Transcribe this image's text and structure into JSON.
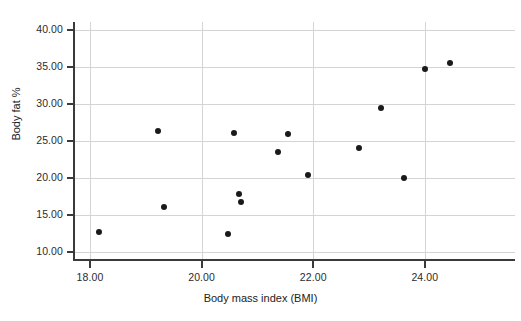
{
  "chart_data": {
    "type": "scatter",
    "title": "",
    "xlabel": "Body mass index (BMI)",
    "ylabel": "Body fat %",
    "xlim": [
      17.55,
      25.45
    ],
    "ylim": [
      8.3,
      41.5
    ],
    "xticks": [
      "18.00",
      "20.00",
      "22.00",
      "24.00"
    ],
    "xtick_values": [
      18,
      20,
      22,
      24
    ],
    "yticks": [
      "10.00",
      "15.00",
      "20.00",
      "25.00",
      "30.00",
      "35.00",
      "40.00"
    ],
    "ytick_values": [
      10,
      15,
      20,
      25,
      30,
      35,
      40
    ],
    "grid": "horizontal-and-vertical",
    "legend": "none",
    "marker": {
      "shape": "circle",
      "color": "#1a1a1a",
      "size": 6
    },
    "points": [
      {
        "x": 18.16,
        "y": 12.7
      },
      {
        "x": 19.22,
        "y": 26.3
      },
      {
        "x": 19.33,
        "y": 16.1
      },
      {
        "x": 20.47,
        "y": 12.5
      },
      {
        "x": 20.58,
        "y": 26.1
      },
      {
        "x": 20.67,
        "y": 17.8
      },
      {
        "x": 20.71,
        "y": 16.7
      },
      {
        "x": 21.37,
        "y": 23.5
      },
      {
        "x": 21.55,
        "y": 26.0
      },
      {
        "x": 21.91,
        "y": 20.4
      },
      {
        "x": 22.82,
        "y": 24.1
      },
      {
        "x": 23.21,
        "y": 29.5
      },
      {
        "x": 23.63,
        "y": 20.0
      },
      {
        "x": 24.0,
        "y": 34.7
      },
      {
        "x": 24.45,
        "y": 35.6
      }
    ]
  },
  "colors": {
    "marker": "#1a1a1a",
    "grid": "#d4d4d4",
    "axis": "#3a3a3a",
    "text": "#222222",
    "background": "#ffffff"
  }
}
